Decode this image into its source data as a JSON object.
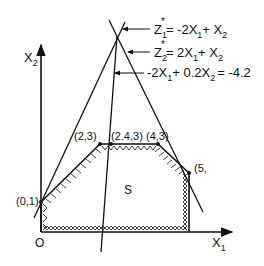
{
  "diagram": {
    "title": "",
    "axes": {
      "x_label": "X",
      "x_sub": "1",
      "y_label": "X",
      "y_sub": "2",
      "origin_label": "O"
    },
    "region_label": "S",
    "vertices": [
      {
        "label": "(0,1)"
      },
      {
        "label": "(2,3)"
      },
      {
        "label": "(2.4,3)",
        "display": "(2.4,3)"
      },
      {
        "label": "(4,3)"
      },
      {
        "label": "(5,",
        "note": "clipped at right edge"
      }
    ],
    "equations": [
      {
        "lhs": "Z",
        "sub": "1",
        "sup": "*",
        "rhs": "= -2X",
        "rhs_sub": "1",
        "rhs_tail": "+ X",
        "tail_sub": "2"
      },
      {
        "lhs": "Z",
        "sub": "2",
        "sup": "*",
        "rhs": "= 2X",
        "rhs_sub": "1",
        "rhs_tail": "+ X",
        "tail_sub": "2"
      },
      {
        "text_a": "-2X",
        "sub_a": "1",
        "text_b": "+ 0.2X",
        "sub_b": "2",
        "text_c": "= -4.2"
      }
    ],
    "colors": {
      "ink": "#111111",
      "background": "#ffffff"
    }
  }
}
